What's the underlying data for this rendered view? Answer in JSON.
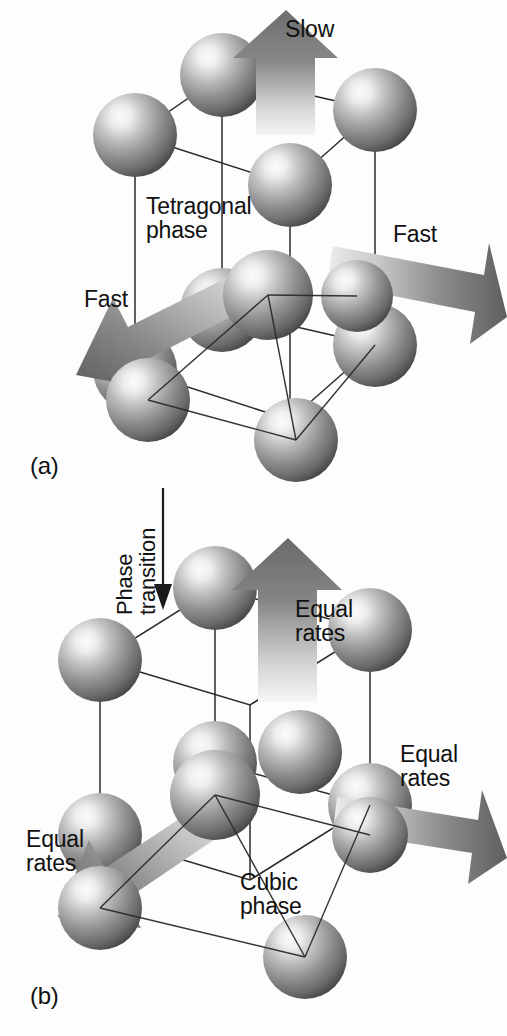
{
  "figure": {
    "background_color": "#fdfdfd",
    "width": 507,
    "height": 1036
  },
  "colors": {
    "sphere_highlight": "#f2f2f2",
    "sphere_mid": "#8d8d8d",
    "sphere_edge": "#3d3d3d",
    "arrow_dark": "#636363",
    "arrow_light": "#e8e8e8",
    "lattice_line": "#2b2b2b",
    "text": "#111111"
  },
  "panels": [
    {
      "id": "a",
      "letter": "(a)",
      "phase_label": "Tetragonal\nphase",
      "phase_name": "Tetragonal phase",
      "lattice": "body-centered tetragonal",
      "sphere_count": 9,
      "arrows": [
        {
          "name": "slow-up-arrow",
          "label": "Slow",
          "direction": "up",
          "rate": "slow",
          "length": "short"
        },
        {
          "name": "fast-right-arrow",
          "label": "Fast",
          "direction": "right",
          "rate": "fast",
          "length": "long"
        },
        {
          "name": "fast-lower-left-arrow",
          "label": "Fast",
          "direction": "lower-left",
          "rate": "fast",
          "length": "long"
        }
      ]
    },
    {
      "id": "b",
      "letter": "(b)",
      "phase_label": "Cubic\nphase",
      "phase_name": "Cubic phase",
      "lattice": "body-centered cubic",
      "sphere_count": 9,
      "arrows": [
        {
          "name": "equal-up-arrow",
          "label": "Equal\nrates",
          "direction": "up",
          "rate": "equal",
          "length": "long"
        },
        {
          "name": "equal-right-arrow",
          "label": "Equal\nrates",
          "direction": "right",
          "rate": "equal",
          "length": "long"
        },
        {
          "name": "equal-lower-left-arrow",
          "label": "Equal\nrates",
          "direction": "lower-left",
          "rate": "equal",
          "length": "long"
        }
      ]
    }
  ],
  "transition": {
    "label": "Phase\ntransition",
    "direction": "downward",
    "orientation": "rotated-90-ccw"
  }
}
